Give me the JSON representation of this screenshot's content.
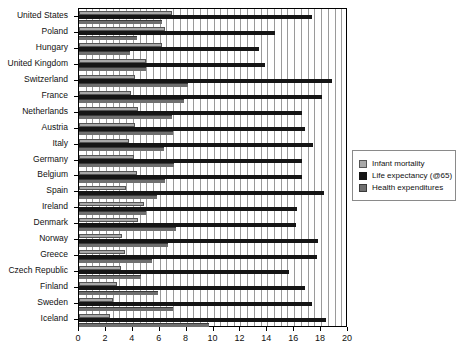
{
  "chart_data": {
    "type": "bar",
    "orientation": "horizontal",
    "title": "",
    "xlabel": "",
    "ylabel": "",
    "xlim": [
      0,
      20
    ],
    "xticks": [
      0,
      2,
      4,
      6,
      8,
      10,
      12,
      14,
      16,
      18,
      20
    ],
    "grid": true,
    "legend_position": "right",
    "categories": [
      "United States",
      "Poland",
      "Hungary",
      "United Kingdom",
      "Switzerland",
      "France",
      "Netherlands",
      "Austria",
      "Italy",
      "Germany",
      "Belgium",
      "Spain",
      "Ireland",
      "Denmark",
      "Norway",
      "Greece",
      "Czech Republic",
      "Finland",
      "Sweden",
      "Iceland"
    ],
    "series": [
      {
        "name": "Infant mortality",
        "color": "#a8a8a8",
        "values": [
          6.9,
          6.4,
          6.2,
          5.0,
          4.2,
          3.9,
          4.4,
          4.2,
          3.7,
          4.1,
          4.3,
          3.5,
          4.8,
          4.4,
          3.2,
          3.4,
          3.1,
          2.8,
          2.5,
          2.3
        ]
      },
      {
        "name": "Life expectancy (@65)",
        "color": "#151515",
        "values": [
          17.3,
          14.6,
          13.4,
          13.8,
          18.8,
          18.1,
          16.6,
          16.8,
          17.4,
          16.6,
          16.6,
          18.2,
          16.2,
          16.1,
          17.8,
          17.7,
          15.6,
          16.8,
          17.3,
          18.4
        ]
      },
      {
        "name": "Health expenditures",
        "color": "#6f6f6f",
        "values": [
          6.2,
          4.3,
          3.8,
          5.0,
          8.1,
          7.8,
          6.9,
          7.0,
          6.3,
          7.1,
          6.4,
          5.8,
          5.0,
          7.2,
          6.6,
          5.4,
          4.6,
          5.9,
          7.0,
          9.7
        ]
      }
    ]
  },
  "legend": {
    "items": [
      {
        "label": "Infant mortality"
      },
      {
        "label": "Life expectancy (@65)"
      },
      {
        "label": "Health expenditures"
      }
    ]
  }
}
